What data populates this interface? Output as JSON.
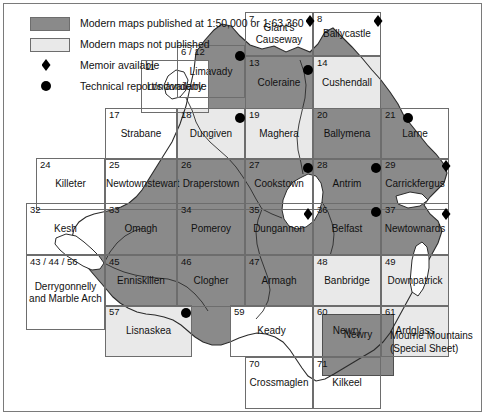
{
  "figure": {
    "kind": "map",
    "region": "Northern Ireland geological map sheet index"
  },
  "legend": {
    "items": [
      {
        "symbol": "dark-swatch",
        "label": "Modern maps published at 1:50,000 or 1:63,360"
      },
      {
        "symbol": "light-swatch",
        "label": "Modern maps not published"
      },
      {
        "symbol": "diamond",
        "label": "Memoir available"
      },
      {
        "symbol": "circle",
        "label": "Technical report/s available"
      }
    ]
  },
  "colors": {
    "published_fill": "#8a8a8a",
    "unpublished_fill": "#e9e9e9",
    "sea_fill": "#ffffff",
    "grid_line": "#6d6d6d",
    "marker": "#000000",
    "text": "#111111",
    "frame": "#7a7a7a"
  },
  "annotations": [
    {
      "name": "mourne-mountains-note-line1",
      "text": "Mourne Mountains"
    },
    {
      "name": "mourne-mountains-note-line2",
      "text": "(Special Sheet)"
    }
  ],
  "map_cells": [
    {
      "id": "7",
      "name": "Giant's",
      "name2": "Causeway",
      "published": true,
      "x": 245,
      "y": 12,
      "w": 68,
      "h": 44
    },
    {
      "id": "8",
      "name": "Ballycastle",
      "published": true,
      "x": 313,
      "y": 12,
      "w": 68,
      "h": 44
    },
    {
      "id": "6 / 12",
      "name": "Limavady",
      "published": true,
      "x": 177,
      "y": 45,
      "w": 68,
      "h": 53
    },
    {
      "id": "11",
      "name": "Londonderry",
      "published": false,
      "x": 141,
      "y": 60,
      "w": 68,
      "h": 53
    },
    {
      "id": "13",
      "name": "Coleraine",
      "published": true,
      "x": 245,
      "y": 56,
      "w": 68,
      "h": 53
    },
    {
      "id": "14",
      "name": "Cushendall",
      "published": false,
      "x": 313,
      "y": 56,
      "w": 68,
      "h": 53
    },
    {
      "id": "17",
      "name": "Strabane",
      "published": false,
      "x": 105,
      "y": 108,
      "w": 72,
      "h": 52
    },
    {
      "id": "18",
      "name": "Dungiven",
      "published": false,
      "x": 177,
      "y": 108,
      "w": 68,
      "h": 52
    },
    {
      "id": "19",
      "name": "Maghera",
      "published": false,
      "x": 245,
      "y": 108,
      "w": 68,
      "h": 52
    },
    {
      "id": "20",
      "name": "Ballymena",
      "published": true,
      "x": 313,
      "y": 108,
      "w": 68,
      "h": 52
    },
    {
      "id": "21",
      "name": "Larne",
      "published": true,
      "x": 381,
      "y": 108,
      "w": 68,
      "h": 52
    },
    {
      "id": "24",
      "name": "Killeter",
      "published": true,
      "x": 36,
      "y": 158,
      "w": 69,
      "h": 52
    },
    {
      "id": "25",
      "name": "Newtownstewart",
      "published": true,
      "x": 105,
      "y": 158,
      "w": 72,
      "h": 52
    },
    {
      "id": "26",
      "name": "Draperstown",
      "published": true,
      "x": 177,
      "y": 158,
      "w": 68,
      "h": 52
    },
    {
      "id": "27",
      "name": "Cookstown",
      "published": true,
      "x": 245,
      "y": 158,
      "w": 68,
      "h": 52
    },
    {
      "id": "28",
      "name": "Antrim",
      "published": true,
      "x": 313,
      "y": 158,
      "w": 68,
      "h": 52
    },
    {
      "id": "29",
      "name": "Carrickfergus",
      "published": true,
      "x": 381,
      "y": 158,
      "w": 68,
      "h": 52
    },
    {
      "id": "32",
      "name": "Kesh",
      "published": false,
      "x": 26,
      "y": 203,
      "w": 79,
      "h": 52
    },
    {
      "id": "33",
      "name": "Omagh",
      "published": true,
      "x": 105,
      "y": 203,
      "w": 72,
      "h": 52
    },
    {
      "id": "34",
      "name": "Pomeroy",
      "published": true,
      "x": 177,
      "y": 203,
      "w": 68,
      "h": 52
    },
    {
      "id": "35",
      "name": "Dungannon",
      "published": true,
      "x": 245,
      "y": 203,
      "w": 68,
      "h": 52
    },
    {
      "id": "36",
      "name": "Belfast",
      "published": true,
      "x": 313,
      "y": 203,
      "w": 68,
      "h": 52
    },
    {
      "id": "37",
      "name": "Newtownards",
      "published": true,
      "x": 381,
      "y": 203,
      "w": 68,
      "h": 52
    },
    {
      "id": "43 / 44 / 56",
      "name": "Derrygonnelly",
      "name2": "and Marble Arch",
      "published": true,
      "x": 26,
      "y": 255,
      "w": 79,
      "h": 75
    },
    {
      "id": "45",
      "name": "Enniskillen",
      "published": true,
      "x": 105,
      "y": 255,
      "w": 72,
      "h": 52
    },
    {
      "id": "46",
      "name": "Clogher",
      "published": true,
      "x": 177,
      "y": 255,
      "w": 68,
      "h": 52
    },
    {
      "id": "47",
      "name": "Armagh",
      "published": true,
      "x": 245,
      "y": 255,
      "w": 68,
      "h": 52
    },
    {
      "id": "48",
      "name": "Banbridge",
      "published": false,
      "x": 313,
      "y": 255,
      "w": 68,
      "h": 52
    },
    {
      "id": "49",
      "name": "Downpatrick",
      "published": false,
      "x": 381,
      "y": 255,
      "w": 68,
      "h": 52
    },
    {
      "id": "57",
      "name": "Lisnaskea",
      "published": false,
      "x": 105,
      "y": 305,
      "w": 87,
      "h": 52
    },
    {
      "id": "59",
      "name": "Keady",
      "published": false,
      "x": 230,
      "y": 305,
      "w": 83,
      "h": 52
    },
    {
      "id": "60",
      "name": "Newry",
      "published": false,
      "x": 313,
      "y": 305,
      "w": 68,
      "h": 52
    },
    {
      "id": "61",
      "name": "Ardglass",
      "published": false,
      "x": 381,
      "y": 305,
      "w": 68,
      "h": 52
    },
    {
      "id": "70",
      "name": "Crossmaglen",
      "published": false,
      "x": 245,
      "y": 357,
      "w": 68,
      "h": 52
    },
    {
      "id": "71",
      "name": "Kilkeel",
      "published": false,
      "x": 313,
      "y": 357,
      "w": 68,
      "h": 52
    }
  ],
  "special_sheet": {
    "label": "Newry",
    "published": true,
    "x": 322,
    "y": 314,
    "w": 72,
    "h": 62
  },
  "markers": [
    {
      "type": "diamond",
      "cell": "7",
      "x": 310,
      "y": 21
    },
    {
      "type": "diamond",
      "cell": "8",
      "x": 378,
      "y": 21
    },
    {
      "type": "circle",
      "cell": "6 / 12",
      "x": 240,
      "y": 56
    },
    {
      "type": "circle",
      "cell": "13",
      "x": 308,
      "y": 70
    },
    {
      "type": "circle",
      "cell": "18",
      "x": 240,
      "y": 118
    },
    {
      "type": "circle",
      "cell": "21",
      "x": 408,
      "y": 118
    },
    {
      "type": "circle",
      "cell": "27",
      "x": 308,
      "y": 168
    },
    {
      "type": "circle",
      "cell": "28",
      "x": 376,
      "y": 168
    },
    {
      "type": "diamond",
      "cell": "29",
      "x": 446,
      "y": 166
    },
    {
      "type": "diamond",
      "cell": "35",
      "x": 308,
      "y": 214
    },
    {
      "type": "circle",
      "cell": "36",
      "x": 376,
      "y": 212
    },
    {
      "type": "diamond",
      "cell": "37",
      "x": 446,
      "y": 214
    },
    {
      "type": "circle",
      "cell": "45",
      "x": 186,
      "y": 313
    }
  ]
}
